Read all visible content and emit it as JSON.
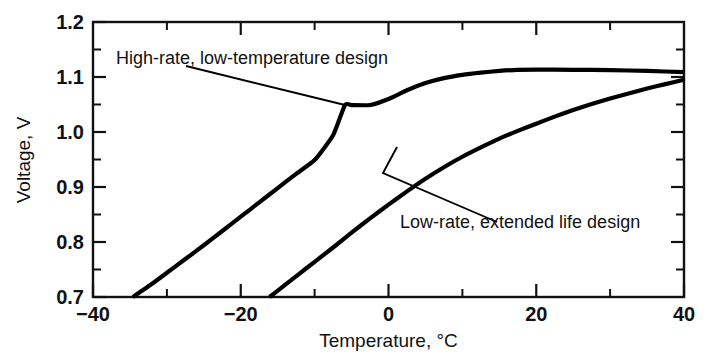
{
  "chart_data": {
    "type": "line",
    "title": "",
    "subtitle": "",
    "xlabel": "Temperature, °C",
    "ylabel": "Voltage, V",
    "xlim": [
      -40,
      40
    ],
    "ylim": [
      0.7,
      1.2
    ],
    "x_ticks": [
      -40,
      -20,
      0,
      20,
      40
    ],
    "x_tick_labels": [
      "−40",
      "−20",
      "0",
      "20",
      "40"
    ],
    "x_minor_ticks": [
      -30,
      -10,
      10,
      30
    ],
    "y_ticks": [
      0.7,
      0.8,
      0.9,
      1.0,
      1.1,
      1.2
    ],
    "y_tick_labels": [
      "0.7",
      "0.8",
      "0.9",
      "1.0",
      "1.1",
      "1.2"
    ],
    "y_minor_ticks": [
      0.75,
      0.85,
      0.95,
      1.05,
      1.15
    ],
    "grid": false,
    "legend": "none",
    "series": [
      {
        "name": "High-rate, low-temperature design",
        "x": [
          -34.6,
          -32,
          -30,
          -27.5,
          -25,
          -22.5,
          -20,
          -17.5,
          -15,
          -12.5,
          -10,
          -7.5,
          -5.9,
          -5,
          -2.5,
          0,
          2.5,
          5,
          7.5,
          10,
          12.5,
          15,
          17.5,
          20,
          25,
          30,
          35,
          40
        ],
        "y": [
          0.7,
          0.724,
          0.744,
          0.769,
          0.794,
          0.82,
          0.846,
          0.872,
          0.898,
          0.924,
          0.949,
          0.994,
          1.049,
          1.018,
          1.04,
          1.06,
          1.076,
          1.089,
          1.098,
          1.104,
          1.108,
          1.111,
          1.113,
          1.1135,
          1.113,
          1.1125,
          1.111,
          1.109
        ]
      },
      {
        "name": "Low-rate, extended life design",
        "x": [
          -16.1,
          -14,
          -12,
          -10,
          -7.5,
          -5,
          -2.5,
          0,
          2.5,
          5,
          7.5,
          10,
          12.5,
          15,
          17.5,
          20,
          22.5,
          25,
          27.5,
          30,
          32.5,
          35,
          37.5,
          40
        ],
        "y": [
          0.7,
          0.722,
          0.743,
          0.764,
          0.79,
          0.817,
          0.843,
          0.868,
          0.892,
          0.915,
          0.936,
          0.955,
          0.972,
          0.988,
          1.002,
          1.015,
          1.028,
          1.04,
          1.051,
          1.061,
          1.07,
          1.079,
          1.087,
          1.095
        ]
      }
    ],
    "annotations": [
      {
        "text": "High-rate, low-temperature design",
        "label_x": -36.0,
        "label_y": 1.154,
        "target_x": -5.9,
        "target_y": 1.049
      },
      {
        "text": "Low-rate, extended life design",
        "label_x": 7.0,
        "label_y": 0.775,
        "target_x": 0.5,
        "target_y": 0.932
      }
    ]
  }
}
